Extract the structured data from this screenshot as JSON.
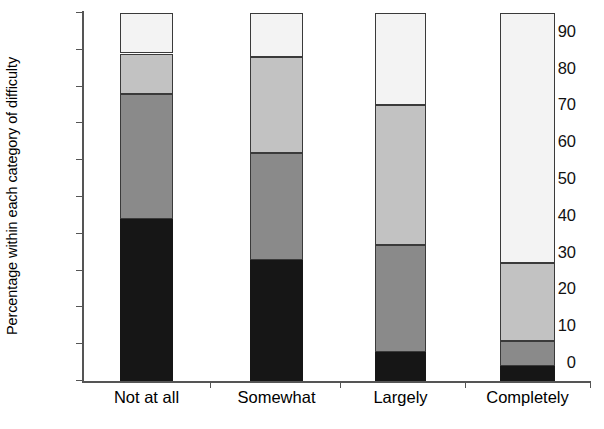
{
  "chart_data": {
    "type": "bar",
    "subtype": "stacked-bar-100",
    "title": "",
    "xlabel": "",
    "ylabel": "Percentage within each category of difficulty",
    "categories": [
      "Not at all",
      "Somewhat",
      "Largely",
      "Completely"
    ],
    "ylim": [
      0,
      100
    ],
    "yticks": [
      0,
      10,
      20,
      30,
      40,
      50,
      60,
      70,
      80,
      90,
      100
    ],
    "ytick_labels": [
      "0",
      "10",
      "20",
      "30",
      "40",
      "50",
      "60",
      "70",
      "80",
      "90",
      "100"
    ],
    "grid": false,
    "legend": "none",
    "series": [
      {
        "name": "segment-1-black",
        "color": "#161616",
        "values": [
          44,
          33,
          8,
          4
        ]
      },
      {
        "name": "segment-2-dark-gray",
        "color": "#8a8a8a",
        "values": [
          34,
          29,
          29,
          7
        ]
      },
      {
        "name": "segment-3-light-gray",
        "color": "#c2c2c2",
        "values": [
          11,
          26,
          38,
          21
        ]
      },
      {
        "name": "segment-4-white",
        "color": "#f3f3f3",
        "values": [
          11,
          12,
          25,
          68
        ]
      }
    ],
    "cumulative_tops": [
      [
        44,
        78,
        89,
        100
      ],
      [
        33,
        62,
        88,
        100
      ],
      [
        8,
        37,
        75,
        100
      ],
      [
        4,
        11,
        32,
        100
      ]
    ],
    "annotations": []
  },
  "axis": {
    "y_title": "Percentage within each category of difficulty"
  }
}
